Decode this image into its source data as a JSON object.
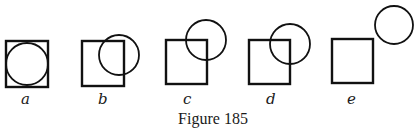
{
  "figure": {
    "caption": "Figure 185",
    "panels": [
      {
        "label": "a",
        "square": {
          "x": 6,
          "y": 41,
          "w": 42,
          "h": 46
        },
        "circle": {
          "cx": 27,
          "cy": 64,
          "r": 21
        }
      },
      {
        "label": "b",
        "square": {
          "x": 82,
          "y": 41,
          "w": 42,
          "h": 45
        },
        "circle": {
          "cx": 119,
          "cy": 55,
          "r": 20
        }
      },
      {
        "label": "c",
        "square": {
          "x": 166,
          "y": 40,
          "w": 41,
          "h": 44
        },
        "circle": {
          "cx": 206,
          "cy": 40,
          "r": 20
        }
      },
      {
        "label": "d",
        "square": {
          "x": 249,
          "y": 40,
          "w": 41,
          "h": 44
        },
        "circle": {
          "cx": 290,
          "cy": 44,
          "r": 20
        }
      },
      {
        "label": "e",
        "square": {
          "x": 332,
          "y": 39,
          "w": 41,
          "h": 44
        },
        "circle": {
          "cx": 394,
          "cy": 25,
          "r": 19
        }
      }
    ]
  }
}
